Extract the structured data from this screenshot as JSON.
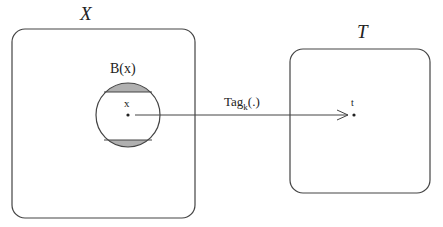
{
  "diagram": {
    "left_set": {
      "label": "X"
    },
    "right_set": {
      "label": "T"
    },
    "ball": {
      "label": "B(x)",
      "center_label": "x"
    },
    "arrow": {
      "label_main": "Tag",
      "label_sub": "k",
      "label_suffix": "(.)"
    },
    "target_point": {
      "label": "t"
    },
    "colors": {
      "stroke": "#333333",
      "shade": "#aaaaaa",
      "background": "#ffffff"
    }
  }
}
